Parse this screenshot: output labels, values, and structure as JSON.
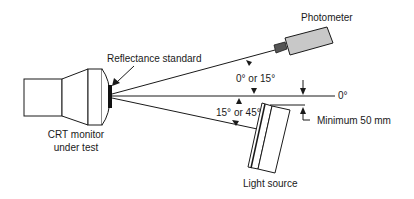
{
  "diagram": {
    "labels": {
      "photometer": "Photometer",
      "reflectance_standard": "Reflectance standard",
      "crt_line1": "CRT monitor",
      "crt_line2": "under test",
      "angle_upper": "0° or 15°",
      "angle_lower": "15° or 45°",
      "zero_deg": "0°",
      "minimum": "Minimum 50 mm",
      "light_source": "Light source"
    },
    "colors": {
      "line": "#1a1a1a",
      "photometer_body": "#c8c8c8",
      "photometer_lens": "#555555",
      "standard": "#111111"
    }
  }
}
